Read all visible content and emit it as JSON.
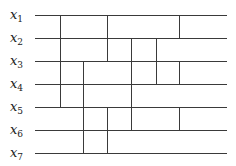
{
  "diagram": {
    "type": "sorting-network",
    "line_color": "#3a3a3a",
    "wires": [
      {
        "label": "x",
        "sub": "1",
        "y": 15
      },
      {
        "label": "x",
        "sub": "2",
        "y": 38
      },
      {
        "label": "x",
        "sub": "3",
        "y": 61
      },
      {
        "label": "x",
        "sub": "4",
        "y": 84
      },
      {
        "label": "x",
        "sub": "5",
        "y": 107
      },
      {
        "label": "x",
        "sub": "6",
        "y": 130
      },
      {
        "label": "x",
        "sub": "7",
        "y": 153
      }
    ],
    "wire_x_start": 35,
    "wire_x_end": 227,
    "comparators": [
      {
        "x": 60,
        "from_wire": 1,
        "to_wire": 5
      },
      {
        "x": 83,
        "from_wire": 3,
        "to_wire": 7
      },
      {
        "x": 107,
        "from_wire": 1,
        "to_wire": 3
      },
      {
        "x": 107,
        "from_wire": 5,
        "to_wire": 7
      },
      {
        "x": 131,
        "from_wire": 2,
        "to_wire": 6
      },
      {
        "x": 156,
        "from_wire": 2,
        "to_wire": 4
      },
      {
        "x": 179,
        "from_wire": 1,
        "to_wire": 2
      },
      {
        "x": 179,
        "from_wire": 3,
        "to_wire": 4
      },
      {
        "x": 179,
        "from_wire": 5,
        "to_wire": 6
      }
    ]
  }
}
